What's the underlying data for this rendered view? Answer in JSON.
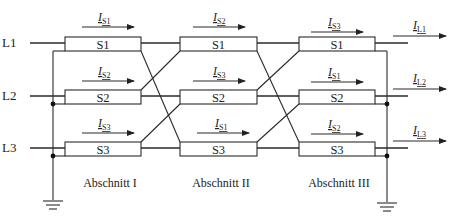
{
  "diagram": {
    "type": "cross-bonding cable sheath schematic",
    "lines": [
      "L1",
      "L2",
      "L3"
    ],
    "sections": [
      {
        "label": "Abschnitt I",
        "boxes": [
          "S1",
          "S2",
          "S3"
        ],
        "currents": [
          {
            "symbol": "I",
            "sub": "S1"
          },
          {
            "symbol": "I",
            "sub": "S2"
          },
          {
            "symbol": "I",
            "sub": "S3"
          }
        ]
      },
      {
        "label": "Abschnitt II",
        "boxes": [
          "S1",
          "S2",
          "S3"
        ],
        "currents": [
          {
            "symbol": "I",
            "sub": "S2"
          },
          {
            "symbol": "I",
            "sub": "S3"
          },
          {
            "symbol": "I",
            "sub": "S1"
          }
        ]
      },
      {
        "label": "Abschnitt III",
        "boxes": [
          "S1",
          "S2",
          "S3"
        ],
        "currents": [
          {
            "symbol": "I",
            "sub": "S3"
          },
          {
            "symbol": "I",
            "sub": "S1"
          },
          {
            "symbol": "I",
            "sub": "S2"
          }
        ]
      }
    ],
    "outputs": [
      {
        "symbol": "I",
        "sub": "L1"
      },
      {
        "symbol": "I",
        "sub": "L2"
      },
      {
        "symbol": "I",
        "sub": "L3"
      }
    ],
    "colors": {
      "line": "#2a2a2a",
      "background": "#ffffff"
    }
  }
}
